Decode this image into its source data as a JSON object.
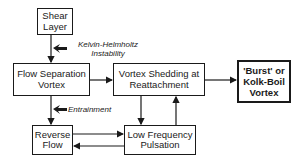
{
  "diagram": {
    "nodes": {
      "shear_layer": "Shear\nLayer",
      "flow_separation_vortex": "Flow Separation\nVortex",
      "vortex_shedding": "Vortex Shedding at\nReattachment",
      "burst_vortex": "'Burst' or\nKolk-Boil\nVortex",
      "reverse_flow": "Reverse\nFlow",
      "low_frequency_pulsation": "Low Frequency\nPulsation"
    },
    "labels": {
      "kelvin_helmholtz": "Kelvin-Helmholtz\nInstability",
      "entrainment": "Entrainment"
    },
    "edges": [
      {
        "from": "shear_layer",
        "to": "flow_separation_vortex"
      },
      {
        "from": "flow_separation_vortex",
        "to": "vortex_shedding"
      },
      {
        "from": "vortex_shedding",
        "to": "burst_vortex"
      },
      {
        "from": "flow_separation_vortex",
        "to": "reverse_flow"
      },
      {
        "from": "vortex_shedding",
        "to": "low_frequency_pulsation"
      },
      {
        "from": "low_frequency_pulsation",
        "to": "vortex_shedding"
      },
      {
        "from": "reverse_flow",
        "to": "low_frequency_pulsation"
      },
      {
        "from": "low_frequency_pulsation",
        "to": "reverse_flow"
      }
    ]
  }
}
